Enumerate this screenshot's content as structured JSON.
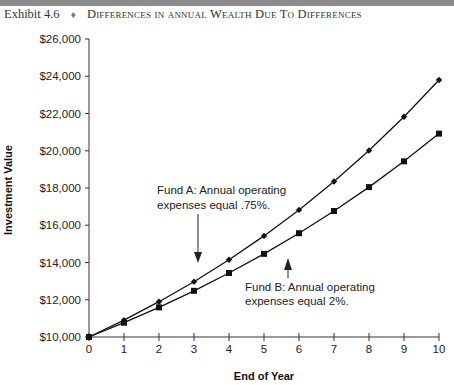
{
  "header": {
    "exhibit_number": "Exhibit 4.6",
    "bullet": "♦",
    "title": "Differences in annual Wealth Due To Differences",
    "bar_color": "#8c8c8c"
  },
  "chart_data": {
    "type": "line",
    "title": "Differences in annual Wealth Due To Differences",
    "xlabel": "End of Year",
    "ylabel": "Investment Value",
    "x": [
      0,
      1,
      2,
      3,
      4,
      5,
      6,
      7,
      8,
      9,
      10
    ],
    "xlim": [
      0,
      10
    ],
    "ylim": [
      10000,
      26000
    ],
    "x_ticks": [
      "0",
      "1",
      "2",
      "3",
      "4",
      "5",
      "6",
      "7",
      "8",
      "9",
      "10"
    ],
    "y_ticks": [
      "$10,000",
      "$12,000",
      "$14,000",
      "$16,000",
      "$18,000",
      "$20,000",
      "$22,000",
      "$24,000",
      "$26,000"
    ],
    "y_tick_values": [
      10000,
      12000,
      14000,
      16000,
      18000,
      20000,
      22000,
      24000,
      26000
    ],
    "grid": false,
    "legend": "none (inline annotations)",
    "series": [
      {
        "name": "Fund A",
        "marker": "diamond",
        "color": "#111111",
        "values": [
          10000,
          10906,
          11894,
          12971,
          14146,
          15427,
          16825,
          18349,
          20011,
          21824,
          23801
        ]
      },
      {
        "name": "Fund B",
        "marker": "square",
        "color": "#111111",
        "values": [
          10000,
          10766,
          11591,
          12479,
          13435,
          14464,
          15572,
          16765,
          18049,
          19432,
          20920
        ]
      }
    ],
    "annotations": [
      {
        "series": "Fund A",
        "line1": "Fund A: Annual operating",
        "line2": "expenses equal .75%.",
        "arrow_at_x": 3.7
      },
      {
        "series": "Fund B",
        "line1": "Fund B: Annual operating",
        "line2": "expenses equal 2%.",
        "arrow_at_x": 6
      }
    ]
  }
}
